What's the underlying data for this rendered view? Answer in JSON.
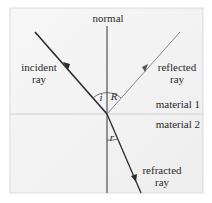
{
  "diagram": {
    "type": "refraction-reflection",
    "labels": {
      "normal": "normal",
      "incident_line1": "incident",
      "incident_line2": "ray",
      "reflected_line1": "reflected",
      "reflected_line2": "ray",
      "refracted_line1": "refracted",
      "refracted_line2": "ray",
      "material1": "material 1",
      "material2": "material 2",
      "angle_incidence": "i",
      "angle_reflection": "R",
      "angle_refraction": "r"
    },
    "colors": {
      "panel_bg": "#f3f3f3",
      "panel_border": "#dcdcdc",
      "interface": "#cfcfcf",
      "incident_ray": "#2b2b2b",
      "reflected_ray": "#8a8a8a",
      "refracted_ray": "#2b2b2b",
      "normal": "#333333"
    }
  }
}
